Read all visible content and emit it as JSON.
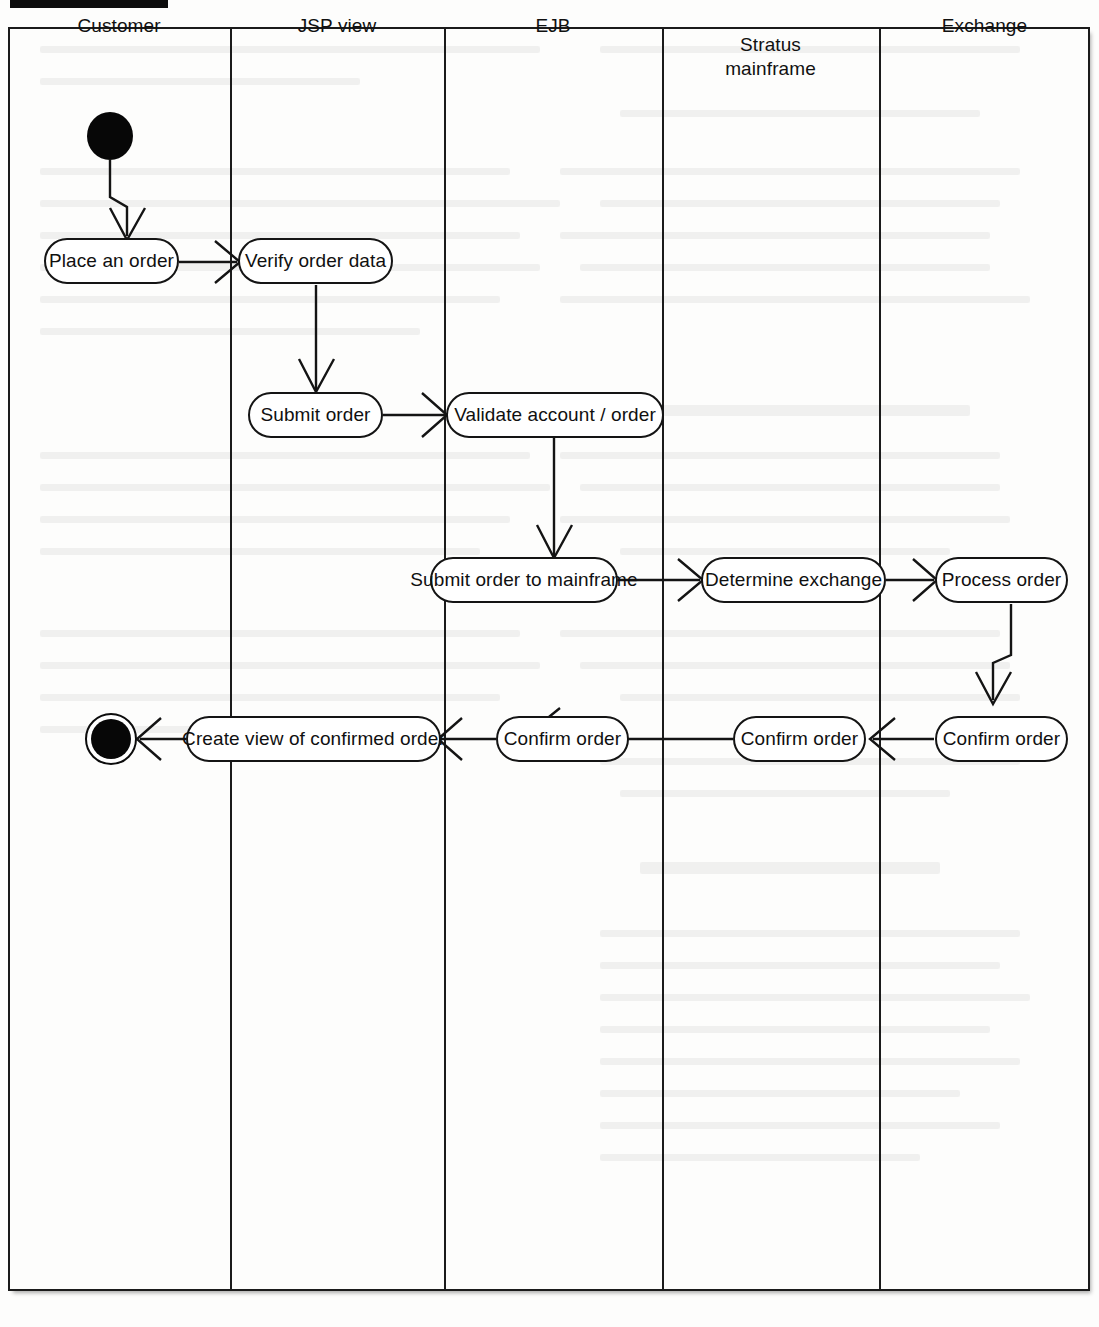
{
  "diagram": {
    "type": "uml-activity-swimlane",
    "title_tab": "",
    "lanes": [
      {
        "id": "customer",
        "label": "Customer",
        "x0": 8,
        "x1": 230
      },
      {
        "id": "jsp",
        "label": "JSP view",
        "x0": 230,
        "x1": 444
      },
      {
        "id": "ejb",
        "label": "EJB",
        "x0": 444,
        "x1": 662
      },
      {
        "id": "mainframe",
        "label": "Stratus\nmainframe",
        "x0": 662,
        "x1": 879
      },
      {
        "id": "exchange",
        "label": "Exchange",
        "x0": 879,
        "x1": 1090
      }
    ],
    "lane_labels": {
      "customer": "Customer",
      "jsp": "JSP view",
      "ejb": "EJB",
      "mainframe_line1": "Stratus",
      "mainframe_line2": "mainframe",
      "exchange": "Exchange"
    },
    "nodes": [
      {
        "id": "start",
        "kind": "initial-state",
        "lane": "customer",
        "label": ""
      },
      {
        "id": "place-order",
        "kind": "activity",
        "lane": "customer",
        "label": "Place an order"
      },
      {
        "id": "verify-order-data",
        "kind": "activity",
        "lane": "jsp",
        "label": "Verify order data"
      },
      {
        "id": "submit-order",
        "kind": "activity",
        "lane": "jsp",
        "label": "Submit order"
      },
      {
        "id": "validate-account",
        "kind": "activity",
        "lane": "ejb",
        "label": "Validate account / order"
      },
      {
        "id": "submit-mainframe",
        "kind": "activity",
        "lane": "ejb",
        "label": "Submit order to mainframe"
      },
      {
        "id": "determine-exchange",
        "kind": "activity",
        "lane": "mainframe",
        "label": "Determine exchange"
      },
      {
        "id": "process-order",
        "kind": "activity",
        "lane": "exchange",
        "label": "Process order"
      },
      {
        "id": "confirm-exchange",
        "kind": "activity",
        "lane": "exchange",
        "label": "Confirm order"
      },
      {
        "id": "confirm-mainframe",
        "kind": "activity",
        "lane": "mainframe",
        "label": "Confirm order"
      },
      {
        "id": "confirm-ejb",
        "kind": "activity",
        "lane": "ejb",
        "label": "Confirm order"
      },
      {
        "id": "create-view",
        "kind": "activity",
        "lane": "jsp",
        "label": "Create view of confirmed order"
      },
      {
        "id": "end",
        "kind": "final-state",
        "lane": "customer",
        "label": ""
      }
    ],
    "transitions": [
      {
        "from": "start",
        "to": "place-order",
        "direction": "down"
      },
      {
        "from": "place-order",
        "to": "verify-order-data",
        "direction": "right"
      },
      {
        "from": "verify-order-data",
        "to": "submit-order",
        "direction": "down"
      },
      {
        "from": "submit-order",
        "to": "validate-account",
        "direction": "right"
      },
      {
        "from": "validate-account",
        "to": "submit-mainframe",
        "direction": "down"
      },
      {
        "from": "submit-mainframe",
        "to": "determine-exchange",
        "direction": "right"
      },
      {
        "from": "determine-exchange",
        "to": "process-order",
        "direction": "right"
      },
      {
        "from": "process-order",
        "to": "confirm-exchange",
        "direction": "down"
      },
      {
        "from": "confirm-exchange",
        "to": "confirm-mainframe",
        "direction": "left"
      },
      {
        "from": "confirm-mainframe",
        "to": "confirm-ejb",
        "direction": "left"
      },
      {
        "from": "confirm-ejb",
        "to": "create-view",
        "direction": "left"
      },
      {
        "from": "create-view",
        "to": "end",
        "direction": "left"
      }
    ],
    "colors": {
      "stroke": "#141414",
      "fill": "#ffffff",
      "page": "#fdfdfc",
      "text": "#101010"
    }
  }
}
